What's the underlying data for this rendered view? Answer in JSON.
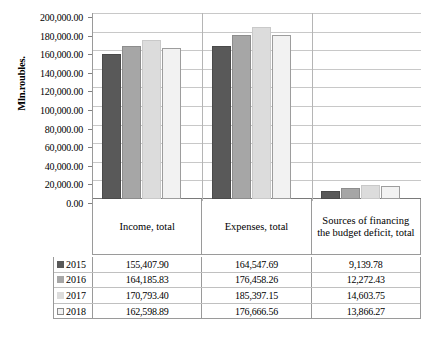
{
  "chart_data": {
    "type": "bar",
    "title": "",
    "xlabel": "",
    "ylabel": "Mln.roubles.",
    "ylim": [
      0,
      200000
    ],
    "ytick_labels": [
      "200,000.00",
      "180,000.00",
      "160,000.00",
      "140,000.00",
      "120,000.00",
      "100,000.00",
      "80,000.00",
      "60,000.00",
      "40,000.00",
      "20,000.00",
      "0.00"
    ],
    "ytick_values": [
      200000,
      180000,
      160000,
      140000,
      120000,
      100000,
      80000,
      60000,
      40000,
      20000,
      0
    ],
    "grid": true,
    "legend_position": "table-left",
    "categories": [
      "Income, total",
      "Expenses, total",
      "Sources of financing the budget deficit, total"
    ],
    "series": [
      {
        "name": "2015",
        "color": "#595959",
        "values": [
          155407.9,
          164547.69,
          9139.78
        ],
        "labels": [
          "155,407.90",
          "164,547.69",
          "9,139.78"
        ]
      },
      {
        "name": "2016",
        "color": "#a6a6a6",
        "values": [
          164185.83,
          176458.26,
          12272.43
        ],
        "labels": [
          "164,185.83",
          "176,458.26",
          "12,272.43"
        ]
      },
      {
        "name": "2017",
        "color": "#dcdcdc",
        "values": [
          170793.4,
          185397.15,
          14603.75
        ],
        "labels": [
          "170,793.40",
          "185,397.15",
          "14,603.75"
        ]
      },
      {
        "name": "2018",
        "color": "#f2f2f2",
        "values": [
          162598.89,
          176666.56,
          13866.27
        ],
        "labels": [
          "162,598.89",
          "176,666.56",
          "13,866.27"
        ]
      }
    ]
  },
  "table": {
    "row_header_labels": [
      "2015",
      "2016",
      "2017",
      "2018"
    ],
    "columns": [
      "Income, total",
      "Expenses, total",
      "Sources of financing the budget deficit, total"
    ],
    "rows": [
      {
        "year": "2015",
        "income": "155,407.90",
        "expenses": "164,547.69",
        "deficit": "9,139.78"
      },
      {
        "year": "2016",
        "income": "164,185.83",
        "expenses": "176,458.26",
        "deficit": "12,272.43"
      },
      {
        "year": "2017",
        "income": "170,793.40",
        "expenses": "185,397.15",
        "deficit": "14,603.75"
      },
      {
        "year": "2018",
        "income": "162,598.89",
        "expenses": "176,666.56",
        "deficit": "13,866.27"
      }
    ]
  }
}
